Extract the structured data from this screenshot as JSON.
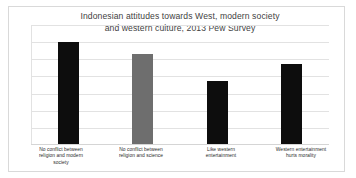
{
  "chart_data": {
    "type": "bar",
    "title": "Indonesian attitudes towards West, modern society and western culture, 2013 Pew Survey",
    "title_lines": [
      "Indonesian attitudes towards West, modern society",
      "and western culture, 2013 Pew Survey"
    ],
    "xlabel": "",
    "ylabel": "",
    "ylim": [
      0,
      105
    ],
    "grid": true,
    "gridline_values": [
      15,
      30,
      45,
      60,
      75,
      90,
      105
    ],
    "legend": "none",
    "axis_tick_labels": [],
    "categories": [
      "No conflict between religion and modern society",
      "No conflict between religion and science",
      "Like western entertainment",
      "Western entertainment hurts morality"
    ],
    "category_label_lines": [
      [
        "No conflict between",
        "religion and modern",
        "society"
      ],
      [
        "No conflict between",
        "religion and science"
      ],
      [
        "Like western",
        "entertainment"
      ],
      [
        "Western entertainment",
        "hurts morality"
      ]
    ],
    "values": [
      89,
      79,
      55,
      70
    ],
    "bar_colors": [
      "#0d0d0d",
      "#6e6e6e",
      "#0d0d0d",
      "#0d0d0d"
    ]
  },
  "colors": {
    "bar_dark": "#0d0d0d",
    "bar_gray": "#6e6e6e",
    "gridline": "#e2e2e2",
    "frame": "#d9d9d9",
    "title_text": "#3f3f3f",
    "label_text": "#2b2b2b",
    "background": "#ffffff"
  }
}
